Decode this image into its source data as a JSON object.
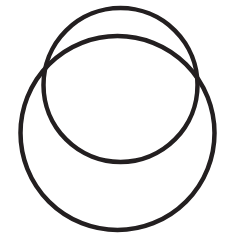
{
  "canvas": {
    "width": 235,
    "height": 250,
    "background_color": "#FFFFFF",
    "title": "Two Overlapping Circles"
  },
  "style": {
    "stroke_color": "#231F20",
    "stroke_width": 4.5,
    "fill": "none",
    "line_cap": "round"
  },
  "figure": {
    "type": "line-drawing",
    "shape_count": 2,
    "shapes": [
      {
        "name": "upper-circle",
        "type": "circle",
        "center_x": 120.5,
        "center_y": 85.0,
        "radius": 77.0,
        "size_label": "smaller",
        "position_label": "upper"
      },
      {
        "name": "lower-circle",
        "type": "circle",
        "center_x": 117.5,
        "center_y": 133.0,
        "radius": 97.0,
        "size_label": "larger",
        "position_label": "lower"
      }
    ],
    "intersections": [
      {
        "name": "left-intersection",
        "x": 44,
        "y": 83
      },
      {
        "name": "right-intersection",
        "x": 197,
        "y": 83
      }
    ]
  }
}
